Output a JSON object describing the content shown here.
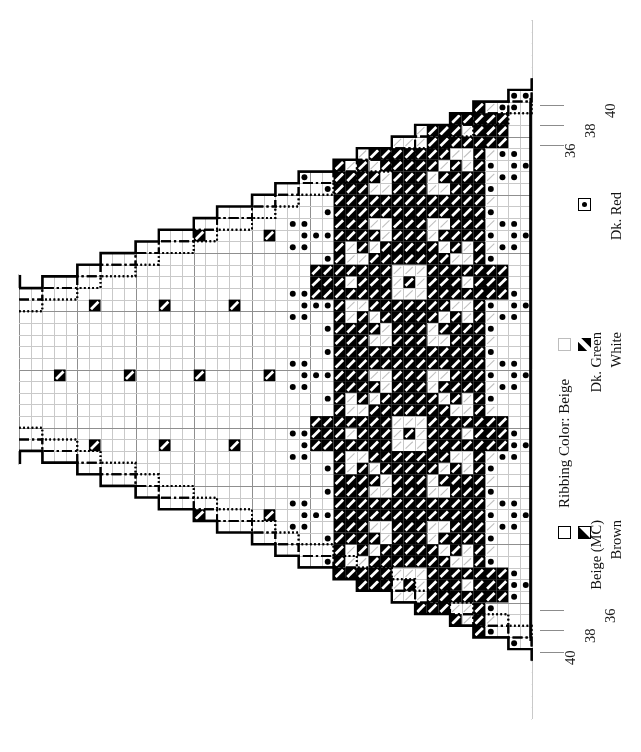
{
  "document": {
    "type": "knitting-colorwork-chart",
    "title": "Nordic Snowflake Sweater Body Chart"
  },
  "ribbing": {
    "caption": "Ribbing Color:  Beige"
  },
  "legend": {
    "columns": [
      {
        "entries": [
          {
            "symbol": "plain-square",
            "label": "Beige (MC)",
            "color": "#ffffff"
          },
          {
            "symbol": "brown-triangle",
            "label": "Brown",
            "color": "#000000"
          }
        ]
      },
      {
        "entries": [
          {
            "symbol": "hatched-square",
            "label": "Dk. Green",
            "color": "#bdbdbd"
          },
          {
            "symbol": "white-diagonal",
            "label": "White",
            "color": "#000000"
          }
        ]
      },
      {
        "entries": [
          {
            "symbol": "dot-square",
            "label": "Dk. Red",
            "color": "#000000"
          }
        ]
      }
    ]
  },
  "size_labels": {
    "top": [
      "36",
      "38",
      "40"
    ],
    "bottom": [
      "36",
      "38",
      "40"
    ]
  },
  "chart_data": {
    "type": "heatmap",
    "xlabel": "",
    "ylabel": "",
    "grid": true,
    "cols": 44,
    "rows": 60,
    "cell_px": 11.65,
    "origin_x": 19,
    "origin_y": 20,
    "legend_position": "right",
    "symbols": {
      "beige": "empty white cell (Main Color)",
      "green": "light hatched cell (Dk. Green)",
      "red": "cell with centered black dot (Dk. Red)",
      "white": "black cell with white diagonal stripe (White)",
      "brown": "black cell with white upper-left triangle (Brown)"
    },
    "green_panel": {
      "col_start": 27,
      "col_end": 40
    },
    "dot_column": {
      "col": 26,
      "row_step": 2,
      "row_offset": 0
    },
    "dot_column_right": {
      "col": 40,
      "row_step": 2,
      "row_offset": 0
    },
    "dot_cluster_period": 6,
    "dot_clusters_left_cols": [
      23,
      24,
      25
    ],
    "dot_clusters_right_cols": [
      41,
      42,
      43
    ],
    "lattice": {
      "description": "Brown/White single-stitch lattice scattered across the beige ground",
      "col_step": 6,
      "row_step": 6,
      "stagger": 3
    },
    "snowflakes": {
      "count": 4,
      "col_center": 33,
      "row_centers": [
        9,
        22,
        35,
        48
      ],
      "size": 17,
      "color": "white"
    },
    "shaping_outlines": [
      {
        "size": "40",
        "style": "solid",
        "line_width": 2.4
      },
      {
        "size": "38",
        "style": "dashdot",
        "line_width": 2.0
      },
      {
        "size": "36",
        "style": "dotted",
        "line_width": 2.0
      }
    ],
    "steps_top": {
      "note": "Stepped raglan/armhole shaping ascending to the right",
      "solid": [
        [
          0,
          1
        ],
        [
          18,
          1
        ],
        [
          18,
          4
        ],
        [
          34,
          4
        ],
        [
          34,
          7
        ],
        [
          49,
          7
        ],
        [
          49,
          10
        ],
        [
          64,
          10
        ],
        [
          64,
          13
        ],
        [
          80,
          13
        ],
        [
          80,
          16
        ],
        [
          95,
          16
        ],
        [
          95,
          19
        ],
        [
          110,
          19
        ],
        [
          110,
          22
        ],
        [
          126,
          22
        ],
        [
          126,
          25
        ],
        [
          141,
          25
        ],
        [
          141,
          28
        ],
        [
          157,
          28
        ],
        [
          157,
          31
        ],
        [
          172,
          31
        ],
        [
          172,
          34
        ],
        [
          188,
          34
        ],
        [
          188,
          37
        ],
        [
          203,
          37
        ],
        [
          203,
          40
        ],
        [
          219,
          40
        ],
        [
          219,
          43
        ],
        [
          234,
          43
        ],
        [
          234,
          46
        ],
        [
          250,
          46
        ],
        [
          250,
          49
        ],
        [
          265,
          49
        ],
        [
          265,
          52
        ],
        [
          281,
          52
        ],
        [
          281,
          55
        ],
        [
          296,
          55
        ],
        [
          296,
          58
        ],
        [
          312,
          58
        ],
        [
          312,
          61
        ],
        [
          327,
          61
        ],
        [
          327,
          64
        ],
        [
          343,
          64
        ],
        [
          343,
          67
        ],
        [
          358,
          67
        ],
        [
          358,
          70
        ],
        [
          374,
          70
        ],
        [
          374,
          73
        ],
        [
          389,
          73
        ],
        [
          389,
          76
        ],
        [
          405,
          76
        ],
        [
          405,
          79
        ],
        [
          420,
          79
        ],
        [
          420,
          82
        ],
        [
          436,
          82
        ],
        [
          436,
          85
        ],
        [
          451,
          85
        ],
        [
          451,
          88
        ],
        [
          467,
          88
        ],
        [
          467,
          91
        ],
        [
          482,
          91
        ],
        [
          482,
          94
        ],
        [
          498,
          94
        ],
        [
          498,
          97
        ],
        [
          513,
          97
        ],
        [
          513,
          100
        ],
        [
          533,
          100
        ]
      ]
    },
    "row_indicators": {
      "top_ticks_y": [
        103,
        123,
        143
      ],
      "bottom_ticks_y": [
        608,
        628,
        650
      ]
    }
  }
}
